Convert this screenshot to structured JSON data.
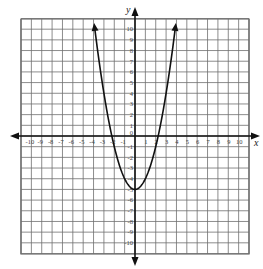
{
  "chart_data": {
    "type": "line",
    "title": "",
    "function": "y = x^2 - 5",
    "xlabel": "x",
    "ylabel": "y",
    "xlim": [
      -11,
      11
    ],
    "ylim": [
      -11,
      11
    ],
    "grid": true,
    "x_ticks": [
      -10,
      -9,
      -8,
      -7,
      -6,
      -5,
      -4,
      -3,
      -2,
      -1,
      1,
      2,
      3,
      4,
      5,
      6,
      7,
      8,
      9,
      10
    ],
    "y_ticks": [
      10,
      9,
      8,
      7,
      6,
      5,
      4,
      3,
      2,
      1,
      0,
      -1,
      -2,
      -3,
      -4,
      -5,
      -6,
      -7,
      -8,
      -9,
      -10
    ],
    "x_tick_labels": [
      "-10",
      "-9",
      "-8",
      "-7",
      "-6",
      "-5",
      "-4",
      "-3",
      "-2",
      "-1",
      "1",
      "2",
      "3",
      "4",
      "5",
      "6",
      "7",
      "8",
      "9",
      "10"
    ],
    "y_tick_labels": [
      "10",
      "9",
      "8",
      "7",
      "6",
      "5",
      "4",
      "3",
      "2",
      "1",
      "0",
      "-1",
      "-2",
      "-3",
      "-4",
      "-5",
      "-6",
      "-7",
      "-8",
      "-9",
      "-10"
    ],
    "series": [
      {
        "name": "parabola",
        "vertex": [
          0,
          -5
        ],
        "x_intercepts": [
          -2.24,
          2.24
        ],
        "arrows_at_ends": true,
        "x": [
          -3.9,
          -3.5,
          -3,
          -2.5,
          -2,
          -1.5,
          -1,
          -0.5,
          0,
          0.5,
          1,
          1.5,
          2,
          2.5,
          3,
          3.5,
          3.9
        ],
        "y": [
          10.21,
          7.25,
          4,
          1.25,
          -1,
          -2.75,
          -4,
          -4.75,
          -5,
          -4.75,
          -4,
          -2.75,
          -1,
          1.25,
          4,
          7.25,
          10.21
        ]
      }
    ],
    "colors": {
      "grid": "#6e6e6e",
      "axis": "#111111",
      "curve": "#111111",
      "background": "#ffffff"
    }
  }
}
